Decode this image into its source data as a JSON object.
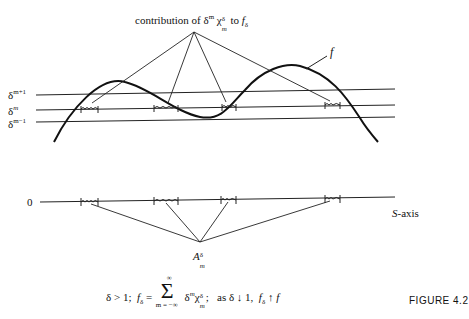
{
  "figure": {
    "label": "FIGURE 4.2",
    "top_annotation": {
      "prefix": "contribution of δ",
      "power": "m",
      "chi": "χ",
      "chi_sup": "δ",
      "chi_sub": "m",
      "middle": " to ",
      "f": "f",
      "f_sub": "δ"
    },
    "f_label": "f",
    "levels": [
      {
        "base": "δ",
        "power": "m+1"
      },
      {
        "base": "δ",
        "power": "m"
      },
      {
        "base": "δ",
        "power": "m−1"
      }
    ],
    "axis": {
      "origin_label": "0",
      "name_italic": "S",
      "name_rest": "-axis"
    },
    "set_label": {
      "base": "A",
      "sup": "δ",
      "sub": "m"
    },
    "caption": {
      "part1": "δ > 1;  ",
      "f": "f",
      "f_sub": "δ",
      "eq": " = ",
      "sum_top": "∞",
      "sum_bottom": "m = −∞",
      "sigma": "Σ",
      "term_base": "δ",
      "term_power": "m",
      "term_chi": "χ",
      "term_chi_sup": "δ",
      "term_chi_sub": "m",
      "after_term": ";   as δ ↓ 1,  ",
      "f2": "f",
      "f2_sub": "δ",
      "arrow_up": " ↑ ",
      "f3": "f"
    },
    "colors": {
      "ink": "#111111",
      "background": "#ffffff"
    }
  }
}
